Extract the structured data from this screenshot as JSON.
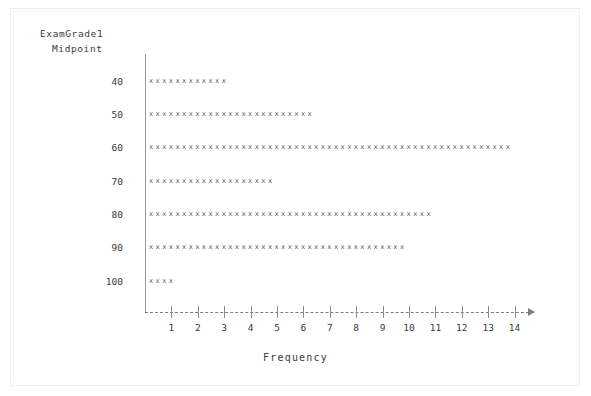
{
  "figure": {
    "caption_line1": "ExamGrade1",
    "caption_line2": "Midpoint",
    "x_axis_title": "Frequency"
  },
  "chart_data": {
    "type": "bar",
    "orientation": "horizontal",
    "style": "character-dotplot-histogram",
    "title": "",
    "xlabel": "Frequency",
    "ylabel": "ExamGrade1 Midpoint",
    "categories": [
      40,
      50,
      60,
      70,
      80,
      90,
      100
    ],
    "values": [
      12,
      25,
      55,
      19,
      43,
      39,
      4
    ],
    "category_labels": [
      "40",
      "50",
      "60",
      "70",
      "80",
      "90",
      "100"
    ],
    "xlim": [
      0,
      14.7
    ],
    "xticks": [
      1,
      2,
      3,
      4,
      5,
      6,
      7,
      8,
      9,
      10,
      11,
      12,
      13,
      14
    ],
    "xtick_labels": [
      "1",
      "2",
      "3",
      "4",
      "5",
      "6",
      "7",
      "8",
      "9",
      "10",
      "11",
      "12",
      "13",
      "14"
    ],
    "marks_per_unit": 4,
    "mark_glyph": "x",
    "grid": false,
    "legend": null,
    "rows": [
      {
        "midpoint": "40",
        "frequency": 12,
        "marks": "xxxxxxxxxxxx"
      },
      {
        "midpoint": "50",
        "frequency": 25,
        "marks": "xxxxxxxxxxxxxxxxxxxxxxxxx"
      },
      {
        "midpoint": "60",
        "frequency": 55,
        "marks": "xxxxxxxxxxxxxxxxxxxxxxxxxxxxxxxxxxxxxxxxxxxxxxxxxxxxxxx"
      },
      {
        "midpoint": "70",
        "frequency": 19,
        "marks": "xxxxxxxxxxxxxxxxxxx"
      },
      {
        "midpoint": "80",
        "frequency": 43,
        "marks": "xxxxxxxxxxxxxxxxxxxxxxxxxxxxxxxxxxxxxxxxxxx"
      },
      {
        "midpoint": "90",
        "frequency": 39,
        "marks": "xxxxxxxxxxxxxxxxxxxxxxxxxxxxxxxxxxxxxxx"
      },
      {
        "midpoint": "100",
        "frequency": 4,
        "marks": "xxxx"
      }
    ]
  },
  "colors": {
    "background": "#ffffff",
    "axis": "#8a8a8a",
    "text": "#3a3a3a",
    "marks": "#5e5e5e",
    "frame": "#f0f0f0"
  }
}
